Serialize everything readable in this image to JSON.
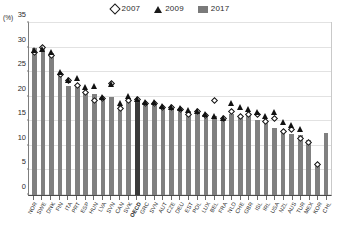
{
  "legend": {
    "entries": [
      {
        "label": "2007",
        "icon": "diamond-marker"
      },
      {
        "label": "2009",
        "icon": "triangle-marker"
      },
      {
        "label": "2017",
        "icon": "bar-swatch"
      }
    ]
  },
  "axis": {
    "unit_label": "(%)",
    "y_ticks": [
      "0",
      "5",
      "10",
      "15",
      "20",
      "25",
      "30",
      "35"
    ]
  },
  "colors": {
    "bar": "#808080",
    "bar_highlight": "#3a3a3a",
    "marker": "#111111",
    "grid": "#e2e2e2",
    "axis": "#4a4a4a"
  },
  "chart_data": {
    "type": "bar",
    "title": "",
    "xlabel": "",
    "ylabel": "(%)",
    "ylim": [
      0,
      35
    ],
    "ytick_step": 5,
    "grid": true,
    "legend_position": "top-center",
    "highlight_category": "OECD",
    "categories": [
      "NOR",
      "SWE",
      "DNK",
      "FIN",
      "ITA",
      "PRT",
      "ESP",
      "HUN",
      "LVA",
      "SVN",
      "CAN",
      "SVK",
      "OECD",
      "GRC",
      "SVN2",
      "AUT",
      "CZE",
      "DEU",
      "EST",
      "POL",
      "LUX",
      "BEL",
      "FRA",
      "NLD",
      "CHE",
      "GBR",
      "ISL",
      "IRL",
      "USA",
      "NZL",
      "AUS",
      "TUR",
      "MEX",
      "KOR",
      "CHL"
    ],
    "series": [
      {
        "name": "2017",
        "marker": "bar",
        "values": [
          30.0,
          30.0,
          29.0,
          24.5,
          22.2,
          22.3,
          20.8,
          20.6,
          19.3,
          19.9,
          18.5,
          19.8,
          19.2,
          18.6,
          18.6,
          17.8,
          17.5,
          17.0,
          17.0,
          16.8,
          16.3,
          16.0,
          15.6,
          16.4,
          16.0,
          16.0,
          15.3,
          14.6,
          13.6,
          13.2,
          12.4,
          12.2,
          11.2,
          6.2,
          12.7
        ]
      },
      {
        "name": "2007",
        "marker": "diamond",
        "values": [
          29.0,
          30.0,
          28.4,
          24.6,
          23.3,
          22.3,
          20.8,
          19.3,
          19.7,
          22.6,
          17.6,
          19.3,
          19.4,
          18.7,
          18.7,
          17.9,
          17.9,
          17.4,
          16.3,
          16.9,
          16.1,
          19.3,
          15.6,
          17.0,
          16.0,
          16.4,
          16.3,
          15.0,
          15.6,
          13.0,
          13.3,
          11.6,
          10.6,
          6.2,
          null
        ]
      },
      {
        "name": "2009",
        "marker": "triangle",
        "values": [
          29.4,
          29.6,
          29.0,
          25.0,
          23.3,
          23.7,
          21.8,
          22.0,
          19.8,
          22.5,
          18.7,
          20.0,
          19.5,
          18.9,
          18.9,
          18.1,
          17.9,
          17.6,
          17.2,
          17.0,
          16.3,
          16.0,
          15.6,
          18.6,
          17.8,
          17.5,
          16.7,
          16.0,
          16.8,
          14.7,
          14.2,
          13.3,
          null,
          null,
          null
        ]
      }
    ]
  }
}
